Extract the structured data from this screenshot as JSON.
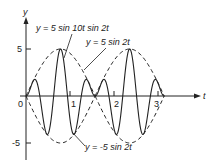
{
  "chart_data": {
    "type": "line",
    "title": "",
    "xlabel": "t",
    "ylabel": "y",
    "x_ticks": [
      "0",
      "1",
      "2",
      "3"
    ],
    "y_ticks": [
      "5",
      "-5"
    ],
    "xlim": [
      0,
      3.14
    ],
    "ylim": [
      -5,
      5
    ],
    "grid": false,
    "series": [
      {
        "name": "y = 5 sin 10t sin 2t",
        "style": "solid",
        "expression": "5*sin(10t)*sin(2t)"
      },
      {
        "name": "y = 5 sin 2t",
        "style": "dashed",
        "expression": "5*sin(2t)"
      },
      {
        "name": "y = -5 sin 2t",
        "style": "dashed",
        "expression": "-5*sin(2t)"
      }
    ],
    "annotations": [
      {
        "text": "y = 5 sin 10t sin 2t",
        "points_to": "solid curve"
      },
      {
        "text": "y = 5 sin 2t",
        "points_to": "upper dashed envelope"
      },
      {
        "text": "y = -5 sin 2t",
        "points_to": "lower dashed envelope"
      }
    ]
  },
  "labels": {
    "y_axis": "y",
    "t_axis": "t",
    "tick_5": "5",
    "tick_neg5": "-5",
    "tick_0": "0",
    "tick_1": "1",
    "tick_2": "2",
    "tick_3": "3",
    "ann_solid": "y = 5 sin 10t sin 2t",
    "ann_upper": "y = 5 sin 2t",
    "ann_lower": "y = -5 sin 2t"
  },
  "geometry": {
    "origin_x": 26,
    "origin_y": 96,
    "px_per_t": 44,
    "px_per_y": 9.4,
    "t_max": 3.14159
  }
}
